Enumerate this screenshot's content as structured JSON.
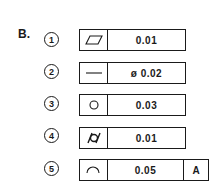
{
  "section_label": "B.",
  "items": [
    {
      "number": "1",
      "symbol": "flatness-icon",
      "value": "0.01",
      "datum": null
    },
    {
      "number": "2",
      "symbol": "straightness-icon",
      "value": "ø 0.02",
      "datum": null
    },
    {
      "number": "3",
      "symbol": "circularity-icon",
      "value": "0.03",
      "datum": null
    },
    {
      "number": "4",
      "symbol": "cylindricity-icon",
      "value": "0.01",
      "datum": null
    },
    {
      "number": "5",
      "symbol": "profile-of-line-icon",
      "value": "0.05",
      "datum": "A"
    }
  ]
}
